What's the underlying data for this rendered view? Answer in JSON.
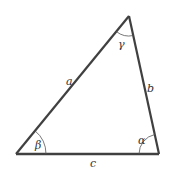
{
  "diagram": {
    "type": "triangle",
    "colors": {
      "edge": "#404040",
      "arc": "#555555",
      "label": "#333333",
      "background": "#ffffff"
    },
    "vertices": {
      "top": {
        "x": 129,
        "y": 16
      },
      "bottom_left": {
        "x": 16,
        "y": 154
      },
      "bottom_right": {
        "x": 159,
        "y": 154
      }
    },
    "sides": [
      {
        "id": "a",
        "label": "a",
        "from": "bottom_left",
        "to": "top"
      },
      {
        "id": "b",
        "label": "b",
        "from": "top",
        "to": "bottom_right"
      },
      {
        "id": "c",
        "label": "c",
        "from": "bottom_left",
        "to": "bottom_right"
      }
    ],
    "angles": [
      {
        "id": "gamma",
        "label": "γ",
        "vertex": "top"
      },
      {
        "id": "beta",
        "label": "β",
        "vertex": "bottom_left"
      },
      {
        "id": "alpha",
        "label": "α",
        "vertex": "bottom_right"
      }
    ]
  }
}
